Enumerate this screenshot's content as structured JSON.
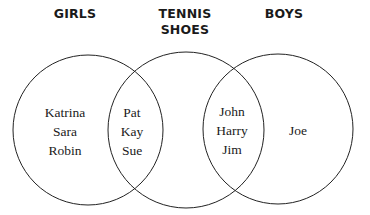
{
  "sets": [
    {
      "name": "GIRLS",
      "only": [
        "Katrina",
        "Sara",
        "Robin"
      ]
    },
    {
      "name": "TENNIS SHOES",
      "name_lines": [
        "TENNIS",
        "SHOES"
      ],
      "only": []
    },
    {
      "name": "BOYS",
      "only": [
        "Joe"
      ]
    }
  ],
  "headers": {
    "girls": "GIRLS",
    "tennis_line1": "TENNIS",
    "tennis_line2": "SHOES",
    "boys": "BOYS"
  },
  "regions": {
    "girls_only": [
      "Katrina",
      "Sara",
      "Robin"
    ],
    "girls_and_tennis": [
      "Pat",
      "Kay",
      "Sue"
    ],
    "tennis_only": [],
    "boys_and_tennis": [
      "John",
      "Harry",
      "Jim"
    ],
    "boys_only": [
      "Joe"
    ]
  },
  "colors": {
    "stroke": "#222222",
    "text": "#1a1a1a",
    "background": "#ffffff"
  }
}
